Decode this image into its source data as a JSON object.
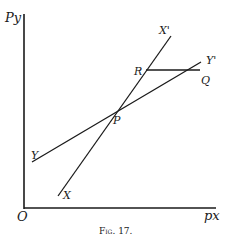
{
  "figure": {
    "caption": "Fig. 17.",
    "axes": {
      "y_label": "Py",
      "x_label": "px",
      "origin_label": "O"
    },
    "lines": [
      {
        "name": "XX'",
        "start_label": "X",
        "end_label": "X'"
      },
      {
        "name": "YY'",
        "start_label": "Y",
        "end_label": "Y'"
      },
      {
        "name": "RQ",
        "start_label": "R",
        "end_label": "Q"
      }
    ],
    "points": {
      "intersection": "P",
      "R": "R",
      "Q": "Q"
    },
    "colors": {
      "ink": "#1a1a1a",
      "background": "#ffffff"
    }
  }
}
